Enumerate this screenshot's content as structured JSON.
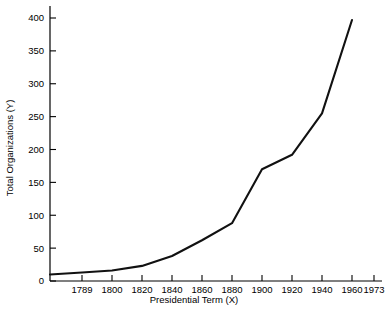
{
  "chart_data": {
    "type": "line",
    "title": "",
    "xlabel": "Presidential Term (X)",
    "ylabel": "Total Organizations (Y)",
    "x_tick_labels": [
      "1789",
      "1800",
      "1820",
      "1840",
      "1860",
      "1880",
      "1900",
      "1920",
      "1940",
      "1960",
      "1973"
    ],
    "y_tick_labels": [
      "0",
      "50",
      "100",
      "150",
      "200",
      "250",
      "300",
      "350",
      "400"
    ],
    "ylim": [
      0,
      400
    ],
    "y_tick_step": 50,
    "grid": false,
    "legend": false,
    "axis_style": "left-and-bottom-spines",
    "x_axis_scale": "ordinal-even-spacing",
    "series": [
      {
        "name": "Total Organizations",
        "color": "#111111",
        "x": [
          "start",
          "1789",
          "1800",
          "1820",
          "1840",
          "1860",
          "1880",
          "1900",
          "1920",
          "1940",
          "1960"
        ],
        "values": [
          10,
          13,
          16,
          23,
          38,
          62,
          88,
          170,
          192,
          255,
          397
        ]
      }
    ],
    "annotations": []
  },
  "axis": {
    "x_title": "Presidential Term (X)",
    "y_title": "Total Organizations (Y)"
  }
}
